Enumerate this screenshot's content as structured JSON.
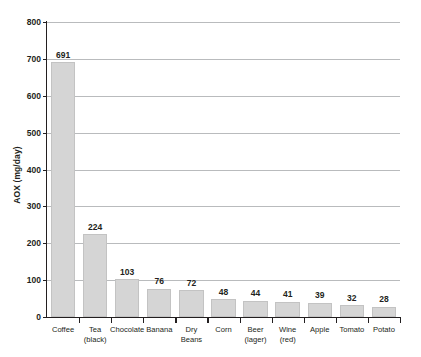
{
  "chart_data": {
    "type": "bar",
    "title": "",
    "xlabel": "",
    "ylabel": "AOX (mg/day)",
    "ylim": [
      0,
      800
    ],
    "ytick_step": 100,
    "yticks": [
      "0",
      "100",
      "200",
      "300",
      "400",
      "500",
      "600",
      "700",
      "800"
    ],
    "grid": true,
    "legend": "none",
    "bar_color": "#d5d5d5",
    "bar_edge_color": "#c3c3c3",
    "axis_color": "#231f20",
    "gridline_color": "#b9bbbd",
    "background": "#ffffff",
    "categories": [
      "Coffee",
      "Tea (black)",
      "Chocolate",
      "Banana",
      "Dry Beans",
      "Corn",
      "Beer (lager)",
      "Wine (red)",
      "Apple",
      "Tomato",
      "Potato"
    ],
    "category_lines": [
      [
        "Coffee",
        ""
      ],
      [
        "Tea",
        "(black)"
      ],
      [
        "Chocolate",
        ""
      ],
      [
        "Banana",
        ""
      ],
      [
        "Dry",
        "Beans"
      ],
      [
        "Corn",
        ""
      ],
      [
        "Beer",
        "(lager)"
      ],
      [
        "Wine",
        "(red)"
      ],
      [
        "Apple",
        ""
      ],
      [
        "Tomato",
        ""
      ],
      [
        "Potato",
        ""
      ]
    ],
    "values": [
      691,
      224,
      103,
      76,
      72,
      48,
      44,
      41,
      39,
      32,
      28
    ],
    "value_labels": [
      "691",
      "224",
      "103",
      "76",
      "72",
      "48",
      "44",
      "41",
      "39",
      "32",
      "28"
    ]
  }
}
